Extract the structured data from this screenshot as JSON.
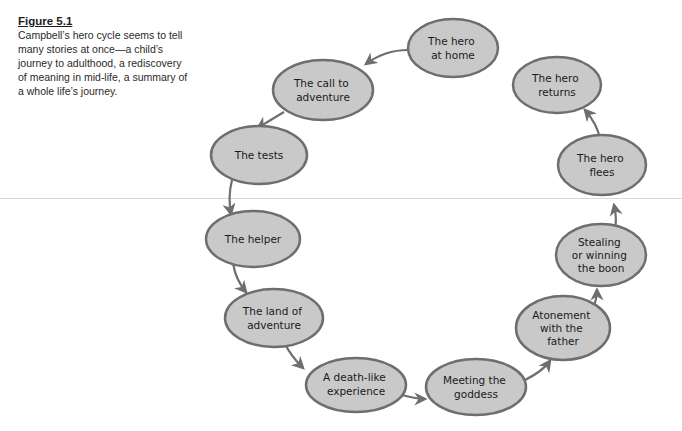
{
  "caption": {
    "title": "Figure 5.1",
    "text": "Campbell’s hero cycle seems to tell many stories at once—a child’s journey to adulthood, a rediscovery of meaning in mid-life, a summary of a whole life’s journey."
  },
  "diagram": {
    "type": "cycle",
    "colors": {
      "node_fill": "#c9c9c9",
      "node_stroke": "#6e6e6e",
      "arrow": "#6e6e6e"
    },
    "nodes": [
      {
        "id": "home",
        "lines": [
          "The hero",
          "at home"
        ]
      },
      {
        "id": "call",
        "lines": [
          "The call to",
          "adventure"
        ]
      },
      {
        "id": "tests",
        "lines": [
          "The tests"
        ]
      },
      {
        "id": "helper",
        "lines": [
          "The helper"
        ]
      },
      {
        "id": "land",
        "lines": [
          "The land of",
          "adventure"
        ]
      },
      {
        "id": "death",
        "lines": [
          "A death-like",
          "experience"
        ]
      },
      {
        "id": "goddess",
        "lines": [
          "Meeting the",
          "goddess"
        ]
      },
      {
        "id": "atonement",
        "lines": [
          "Atonement",
          "with the",
          "father"
        ]
      },
      {
        "id": "boon",
        "lines": [
          "Stealing",
          "or winning",
          "the boon"
        ]
      },
      {
        "id": "flees",
        "lines": [
          "The hero",
          "flees"
        ]
      },
      {
        "id": "returns",
        "lines": [
          "The hero",
          "returns"
        ]
      }
    ],
    "edges": [
      [
        "home",
        "call"
      ],
      [
        "call",
        "tests"
      ],
      [
        "tests",
        "helper"
      ],
      [
        "helper",
        "land"
      ],
      [
        "land",
        "death"
      ],
      [
        "death",
        "goddess"
      ],
      [
        "goddess",
        "atonement"
      ],
      [
        "atonement",
        "boon"
      ],
      [
        "boon",
        "flees"
      ],
      [
        "flees",
        "returns"
      ]
    ]
  }
}
